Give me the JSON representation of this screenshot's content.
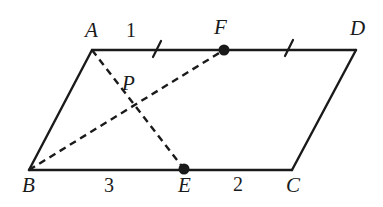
{
  "figure": {
    "type": "geometry-diagram",
    "shape": "parallelogram",
    "width": 383,
    "height": 207,
    "background_color": "#ffffff",
    "stroke_color": "#1a1a1a",
    "solid_stroke_width": 2.4,
    "dashed_stroke_width": 2.4,
    "dash_pattern": "7 5"
  },
  "points": {
    "A": {
      "label": "A",
      "x": 92,
      "y": 50,
      "label_x": 85,
      "label_y": 20
    },
    "B": {
      "label": "B",
      "x": 29,
      "y": 170,
      "label_x": 22,
      "label_y": 175
    },
    "C": {
      "label": "C",
      "x": 292,
      "y": 170,
      "label_x": 286,
      "label_y": 175
    },
    "D": {
      "label": "D",
      "x": 356,
      "y": 50,
      "label_x": 350,
      "label_y": 18
    },
    "E": {
      "label": "E",
      "x": 184,
      "y": 169,
      "label_x": 178,
      "label_y": 175,
      "marker": "filled-dot",
      "marker_radius": 5.5
    },
    "F": {
      "label": "F",
      "x": 224,
      "y": 50,
      "label_x": 214,
      "label_y": 17,
      "marker": "filled-dot",
      "marker_radius": 5.5
    },
    "P": {
      "label": "P",
      "x": 133,
      "y": 105,
      "label_x": 122,
      "label_y": 73
    }
  },
  "solid_segments": [
    {
      "name": "segment-AD",
      "from": "A",
      "to": "D"
    },
    {
      "name": "segment-AB",
      "from": "A",
      "to": "B"
    },
    {
      "name": "segment-BC",
      "from": "B",
      "to": "C"
    },
    {
      "name": "segment-DC",
      "from": "D",
      "to": "C"
    }
  ],
  "dashed_segments": [
    {
      "name": "segment-AE",
      "from": "A",
      "to": "E"
    },
    {
      "name": "segment-BF",
      "from": "B",
      "to": "F"
    }
  ],
  "tick_marks": [
    {
      "name": "tick-AF",
      "x": 157,
      "y": 49,
      "segment": "A-F"
    },
    {
      "name": "tick-FD",
      "x": 289,
      "y": 48,
      "segment": "F-D"
    }
  ],
  "segment_labels": [
    {
      "name": "length-label-AF",
      "text": "1",
      "x": 126,
      "y": 20
    },
    {
      "name": "length-label-BE",
      "text": "3",
      "x": 104,
      "y": 175
    },
    {
      "name": "length-label-EC",
      "text": "2",
      "x": 233,
      "y": 174
    }
  ]
}
